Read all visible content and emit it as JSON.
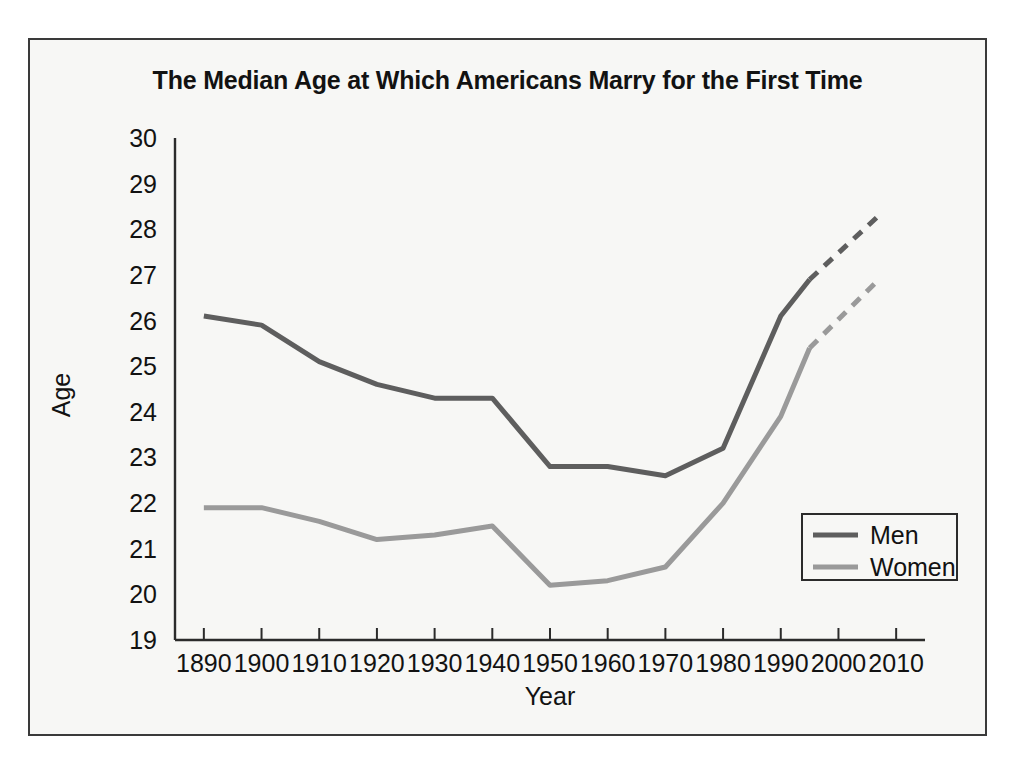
{
  "chart_data": {
    "type": "line",
    "title": "The Median Age at Which Americans Marry for the First Time",
    "xlabel": "Year",
    "ylabel": "Age",
    "xlim": [
      1885,
      2015
    ],
    "ylim": [
      19,
      30
    ],
    "grid": false,
    "legend_position": "bottom-right",
    "x_ticks": [
      1890,
      1900,
      1910,
      1920,
      1930,
      1940,
      1950,
      1960,
      1970,
      1980,
      1990,
      2000,
      2010
    ],
    "y_ticks": [
      19,
      20,
      21,
      22,
      23,
      24,
      25,
      26,
      27,
      28,
      29,
      30
    ],
    "series": [
      {
        "name": "Men",
        "color": "#5e5e5e",
        "x": [
          1890,
          1900,
          1910,
          1920,
          1930,
          1940,
          1950,
          1960,
          1970,
          1980,
          1990,
          1995
        ],
        "values": [
          26.1,
          25.9,
          25.1,
          24.6,
          24.3,
          24.3,
          22.8,
          22.8,
          22.6,
          23.2,
          26.1,
          26.9
        ],
        "projected_x": [
          1995,
          2007
        ],
        "projected_values": [
          26.9,
          28.3
        ],
        "style": "solid-then-dashed"
      },
      {
        "name": "Women",
        "color": "#9a9a9a",
        "x": [
          1890,
          1900,
          1910,
          1920,
          1930,
          1940,
          1950,
          1960,
          1970,
          1980,
          1990,
          1995
        ],
        "values": [
          21.9,
          21.9,
          21.6,
          21.2,
          21.3,
          21.5,
          20.2,
          20.3,
          20.6,
          22.0,
          23.9,
          25.4
        ],
        "projected_x": [
          1995,
          2007
        ],
        "projected_values": [
          25.4,
          26.9
        ],
        "style": "solid-then-dashed"
      }
    ]
  },
  "legend": {
    "entries": [
      {
        "label": "Men"
      },
      {
        "label": "Women"
      }
    ]
  },
  "colors": {
    "men": "#5e5e5e",
    "women": "#9a9a9a",
    "axis": "#2b2b2b",
    "background": "#f7f7f5",
    "frame": "#3a3a3a"
  }
}
